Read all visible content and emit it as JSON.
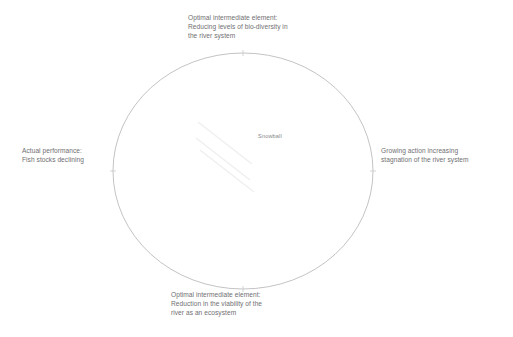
{
  "diagram": {
    "type": "causal-loop-diagram",
    "center_label": "Snowball",
    "loop_color": "#a9a9ae",
    "text_color": "#6f6f72",
    "background_color": "#ffffff",
    "glyph_color": "#efeff2",
    "nodes": [
      {
        "position": "top",
        "name": "optimal-intermediate-element-bio-diversity",
        "text": "Optimal intermediate element:\nReducing levels of bio-diversity in\nthe river system"
      },
      {
        "position": "right",
        "name": "growing-action-stagnation",
        "text": "Growing action increasing\nstagnation of the river system"
      },
      {
        "position": "bottom",
        "name": "optimal-intermediate-element-viability",
        "text": "Optimal intermediate element:\nReduction in the viability of the\nriver as an ecosystem"
      },
      {
        "position": "left",
        "name": "actual-performance-fish-stocks",
        "text": "Actual performance:\nFish stocks declining"
      }
    ],
    "geometry": {
      "center_x": 243,
      "center_y": 171,
      "radius_x": 130,
      "radius_y": 118
    }
  }
}
